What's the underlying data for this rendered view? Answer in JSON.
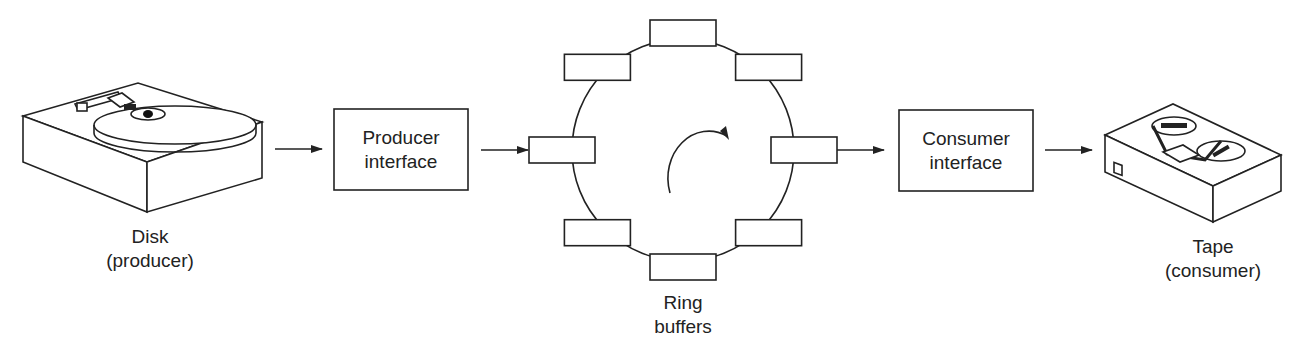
{
  "diagram": {
    "producer": {
      "icon": "disk-drive-icon",
      "label_line1": "Disk",
      "label_line2": "(producer)"
    },
    "producer_interface": {
      "line1": "Producer",
      "line2": "interface"
    },
    "ring": {
      "icon": "clockwise-arrow-icon",
      "buffer_count": 8,
      "label_line1": "Ring",
      "label_line2": "buffers"
    },
    "consumer_interface": {
      "line1": "Consumer",
      "line2": "interface"
    },
    "consumer": {
      "icon": "tape-drive-icon",
      "label_line1": "Tape",
      "label_line2": "(consumer)"
    },
    "flow": [
      "Disk (producer)",
      "Producer interface",
      "Ring buffers",
      "Consumer interface",
      "Tape (consumer)"
    ]
  }
}
